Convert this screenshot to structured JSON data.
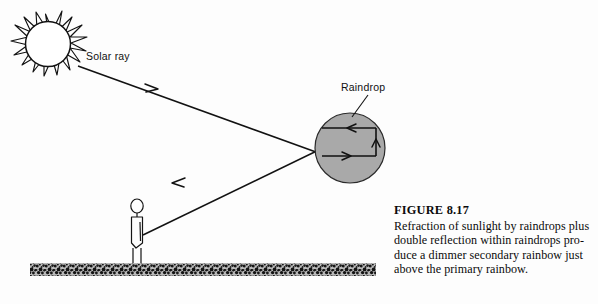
{
  "figure": {
    "labels": {
      "solar_ray": "Solar ray",
      "raindrop": "Raindrop"
    },
    "caption": {
      "title": "FIGURE 8.17",
      "line1": "Refraction of sunlight by raindrops plus",
      "line2": "double reflection within raindrops pro-",
      "line3": "duce a dimmer secondary rainbow just",
      "line4": "above the primary rainbow."
    },
    "icons": {
      "sun": "sun-icon",
      "raindrop": "raindrop-circle-icon",
      "observer": "observer-person-icon",
      "ground": "ground-texture-icon",
      "incoming_ray_arrow": "arrow-right-down-icon",
      "outgoing_ray_arrow": "arrow-left-down-icon",
      "internal_bottom_arrow": "arrow-right-icon",
      "internal_right_arrow": "arrow-up-icon",
      "internal_top_arrow": "arrow-left-icon"
    },
    "colors": {
      "ink": "#111111",
      "raindrop_fill": "#a9a9a9",
      "raindrop_stroke": "#1a1a1a",
      "ground": "#1c1c1c",
      "background": "#fdfdfd"
    }
  }
}
